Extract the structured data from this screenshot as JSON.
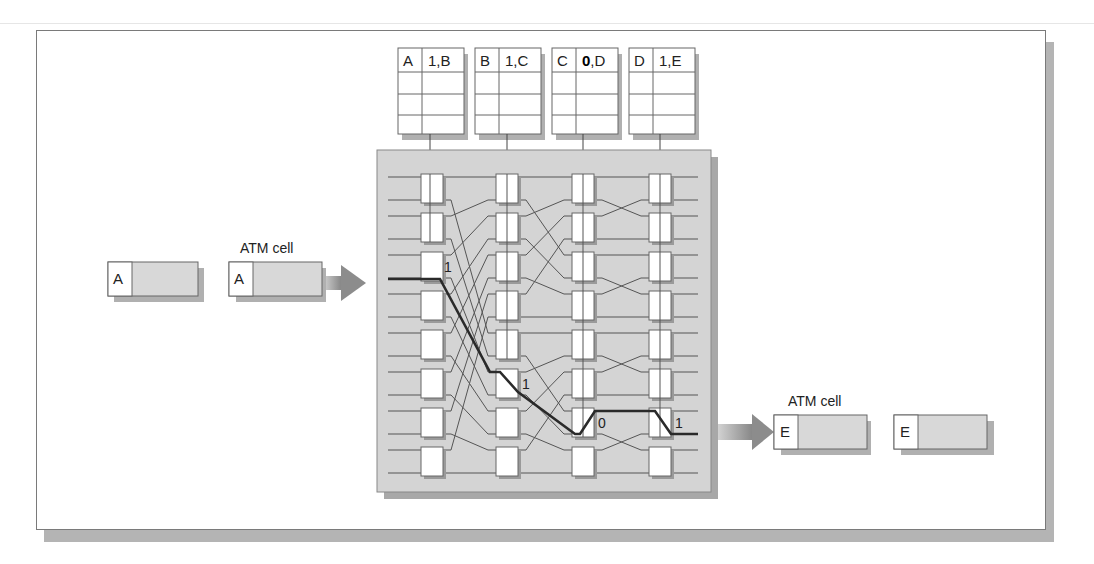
{
  "diagram": {
    "input": {
      "waiting_cell": {
        "header": "A"
      },
      "atm_cell_label": "ATM cell",
      "entering_cell": {
        "header": "A"
      }
    },
    "output": {
      "atm_cell_label": "ATM cell",
      "exiting_cell": {
        "header": "E"
      },
      "departed_cell": {
        "header": "E"
      }
    },
    "routing_tables": [
      {
        "in": "A",
        "out": "1,B"
      },
      {
        "in": "B",
        "out": "1,C"
      },
      {
        "in": "C",
        "out": "0,D",
        "note": "0 rendered as bold black glyph"
      },
      {
        "in": "D",
        "out": "1,E"
      }
    ],
    "stage_bits": {
      "stage1": "1",
      "stage2": "1",
      "stage3": "0",
      "stage4": "1"
    },
    "switch": {
      "stages": 4,
      "elements_per_stage": 8,
      "lines_per_stage": 16
    },
    "colors": {
      "panel": "#d4d4d4",
      "panel_shadow": "#a8a8a8",
      "cell_body": "#d8d8d8",
      "line": "#555555",
      "route": "#2a2a2a",
      "arrow": "#9a9a9a"
    }
  }
}
